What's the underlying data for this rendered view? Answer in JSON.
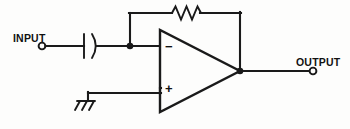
{
  "diagram": {
    "background_color": "#fdfdfc",
    "line_color": "#1a1a1a",
    "terminals": [
      {
        "id": "input",
        "label": "INPUT",
        "x": 42,
        "y": 46
      },
      {
        "id": "output",
        "label": "OUTPUT",
        "x": 313,
        "y": 71
      }
    ],
    "labels": {
      "input": "INPUT",
      "output": "OUTPUT",
      "inverting_sign": "−",
      "noninverting_sign": "+"
    },
    "components": [
      {
        "id": "coupling-capacitor",
        "type": "capacitor",
        "style": "polarized-curved-plate",
        "x": 88,
        "y": 46
      },
      {
        "id": "feedback-resistor",
        "type": "resistor",
        "style": "zigzag",
        "x": 185,
        "y": 13
      },
      {
        "id": "opamp",
        "type": "operational-amplifier",
        "apex_x": 240,
        "apex_y": 71,
        "left_x": 160,
        "top_y": 30,
        "bottom_y": 112,
        "inverting_input_y": 46,
        "noninverting_input_y": 88
      },
      {
        "id": "ground",
        "type": "chassis-ground",
        "x": 88,
        "y": 93
      }
    ],
    "junctions": [
      {
        "id": "inverting-node",
        "x": 130,
        "y": 46
      },
      {
        "id": "output-node",
        "x": 240,
        "y": 71
      }
    ]
  }
}
